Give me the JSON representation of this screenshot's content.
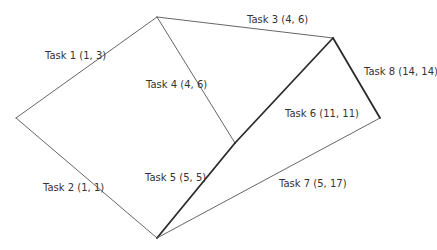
{
  "diagram": {
    "type": "activity-network",
    "nodes": [
      {
        "id": "n1",
        "x": 16,
        "y": 118
      },
      {
        "id": "n2",
        "x": 157,
        "y": 17
      },
      {
        "id": "n3",
        "x": 157,
        "y": 238
      },
      {
        "id": "n4",
        "x": 333,
        "y": 38
      },
      {
        "id": "n5",
        "x": 235,
        "y": 143
      },
      {
        "id": "n6",
        "x": 380,
        "y": 118
      }
    ],
    "edges": [
      {
        "id": "task1",
        "from": "n1",
        "to": "n2",
        "label": "Task 1 (1, 3)",
        "critical": false,
        "lx": 45,
        "ly": 59
      },
      {
        "id": "task2",
        "from": "n1",
        "to": "n3",
        "label": "Task 2 (1, 1)",
        "critical": false,
        "lx": 43,
        "ly": 191
      },
      {
        "id": "task3",
        "from": "n2",
        "to": "n4",
        "label": "Task 3 (4, 6)",
        "critical": false,
        "lx": 247,
        "ly": 23
      },
      {
        "id": "task4",
        "from": "n2",
        "to": "n5",
        "label": "Task 4 (4, 6)",
        "critical": false,
        "lx": 146,
        "ly": 88
      },
      {
        "id": "task5",
        "from": "n3",
        "to": "n5",
        "label": "Task 5 (5, 5)",
        "critical": true,
        "lx": 145,
        "ly": 181
      },
      {
        "id": "task6",
        "from": "n5",
        "to": "n4",
        "label": "Task 6 (11, 11)",
        "critical": true,
        "lx": 285,
        "ly": 117
      },
      {
        "id": "task7",
        "from": "n3",
        "to": "n6",
        "label": "Task 7 (5, 17)",
        "critical": false,
        "lx": 279,
        "ly": 187
      },
      {
        "id": "task8",
        "from": "n4",
        "to": "n6",
        "label": "Task 8 (14, 14)",
        "critical": true,
        "lx": 364,
        "ly": 75
      }
    ]
  }
}
